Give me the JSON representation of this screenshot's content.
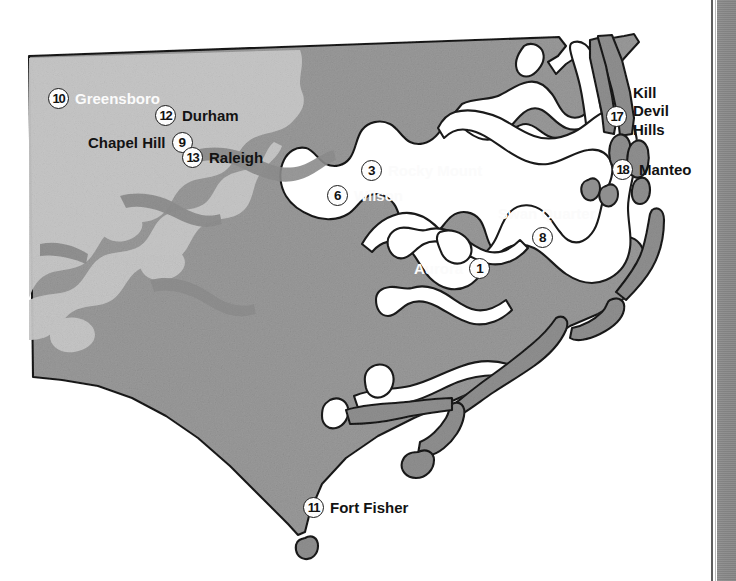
{
  "map": {
    "title": "North Carolina",
    "region": "North Carolina coastal and piedmont locator map",
    "colors": {
      "land": "#9a9a9a",
      "land_upland": "#c8c8c8",
      "water": "#ffffff",
      "barrier_island": "#8f8f8f",
      "outline": "#1a1a1a",
      "label_dark": "#131313",
      "label_light": "#fbfbfb",
      "page_band": "#8a8a8a"
    },
    "places": [
      {
        "number": "10",
        "label": "Greensboro",
        "label_side": "right",
        "label_color": "light",
        "x": 48,
        "y": 88
      },
      {
        "number": "12",
        "label": "Durham",
        "label_side": "right",
        "label_color": "dark",
        "x": 155,
        "y": 105
      },
      {
        "number": "9",
        "label": "Chapel Hill",
        "label_side": "left",
        "label_color": "dark",
        "x": 158,
        "y": 132
      },
      {
        "number": "13",
        "label": "Raleigh",
        "label_side": "right",
        "label_color": "dark",
        "x": 182,
        "y": 147
      },
      {
        "number": "3",
        "label": "Rocky Mount",
        "label_side": "right",
        "label_color": "light",
        "x": 361,
        "y": 160
      },
      {
        "number": "6",
        "label": "Wilson",
        "label_side": "right",
        "label_color": "light",
        "x": 327,
        "y": 185
      },
      {
        "number": "8",
        "label": "Swan Quarter",
        "label_side": "above",
        "label_color": "light",
        "x": 532,
        "y": 227
      },
      {
        "number": "1",
        "label": "Aurora",
        "label_side": "left",
        "label_color": "light",
        "x": 462,
        "y": 258
      },
      {
        "number": "17",
        "label": "Kill\nDevil\nHills",
        "label_side": "right",
        "label_color": "dark",
        "x": 608,
        "y": 119
      },
      {
        "number": "18",
        "label": "Manteo",
        "label_side": "right",
        "label_color": "dark",
        "x": 614,
        "y": 159
      },
      {
        "number": "11",
        "label": "Fort  Fisher",
        "label_side": "right",
        "label_color": "dark",
        "x": 303,
        "y": 497
      }
    ]
  }
}
